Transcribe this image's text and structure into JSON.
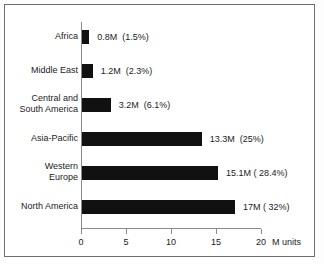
{
  "chart_data": {
    "type": "bar",
    "orientation": "horizontal",
    "title": "",
    "xlabel": "M units",
    "ylabel": "",
    "xlim": [
      0,
      20
    ],
    "grid": false,
    "legend": false,
    "categories": [
      "Africa",
      "Middle East",
      "Central and South America",
      "Asia-Pacific",
      "Western Europe",
      "North America"
    ],
    "values": [
      0.8,
      1.2,
      3.2,
      13.3,
      15.1,
      17
    ],
    "percentages": [
      1.5,
      2.3,
      6.1,
      25,
      28.4,
      32
    ],
    "data_labels": [
      "0.8M  (1.5%)",
      "1.2M  (2.3%)",
      "3.2M  (6.1%)",
      "13.3M  (25%)",
      "15.1M ( 28.4%)",
      "17M ( 32%)"
    ],
    "xticks": [
      0,
      5,
      10,
      15,
      20
    ],
    "xtick_labels": [
      "0",
      "5",
      "10",
      "15",
      "20"
    ],
    "bar_color": "#111111",
    "axis_color": "#8a8a8a",
    "background_color": "#ffffff"
  },
  "axis": {
    "unit_label": "M units"
  },
  "rows": [
    {
      "label_line1": "Africa",
      "label_line2": "",
      "value_label": "0.8M  (1.5%)"
    },
    {
      "label_line1": "Middle East",
      "label_line2": "",
      "value_label": "1.2M  (2.3%)"
    },
    {
      "label_line1": "Central and",
      "label_line2": "South America",
      "value_label": "3.2M  (6.1%)"
    },
    {
      "label_line1": "Asia-Pacific",
      "label_line2": "",
      "value_label": "13.3M  (25%)"
    },
    {
      "label_line1": "Western",
      "label_line2": "Europe",
      "value_label": "15.1M ( 28.4%)"
    },
    {
      "label_line1": "North America",
      "label_line2": "",
      "value_label": "17M ( 32%)"
    }
  ]
}
